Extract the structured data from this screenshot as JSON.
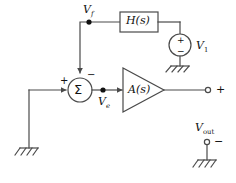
{
  "diagram": {
    "background": "#ffffff",
    "line_color": "#4a4a4a",
    "text_color": "#111111"
  },
  "blocks": {
    "feedback_network": {
      "label_main": "H",
      "label_arg": "(s)",
      "name": "H(s)"
    },
    "amplifier": {
      "label_main": "A",
      "label_arg": "(s)",
      "name": "A(s)"
    },
    "summing_junction": {
      "symbol": "Σ",
      "input_plus": "+",
      "input_minus": "−"
    }
  },
  "sources": {
    "v1": {
      "label_main": "V",
      "label_sub": "1",
      "plus": "+",
      "minus": "−"
    }
  },
  "nodes": {
    "vf": {
      "label_main": "V",
      "label_sub": "f"
    },
    "ve": {
      "label_main": "V",
      "label_sub": "e"
    }
  },
  "terminals": {
    "out_positive": {
      "sign": "+"
    },
    "out_negative": {
      "sign": "−"
    },
    "vout": {
      "label_main": "V",
      "label_sub": "out"
    }
  },
  "grounds": {
    "left": "ground-symbol",
    "source": "ground-symbol",
    "output": "ground-symbol"
  }
}
